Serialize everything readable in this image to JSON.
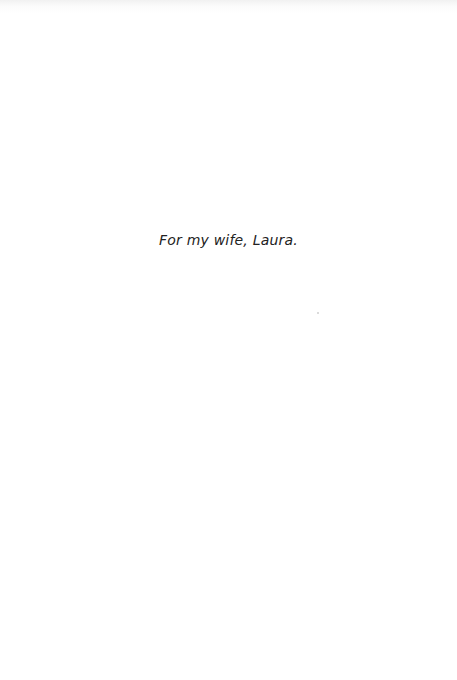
{
  "page": {
    "dedication": "For my wife, Laura."
  }
}
